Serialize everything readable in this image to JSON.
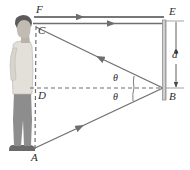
{
  "figure": {
    "labels": {
      "F": "F",
      "C": "C",
      "D": "D",
      "A": "A",
      "E": "E",
      "B": "B",
      "d": "d",
      "theta_upper": "θ",
      "theta_lower": "θ"
    },
    "colors": {
      "line": "#6e6e6e",
      "dashed": "#7d7d7d",
      "mirror": "#9a9a9a",
      "label": "#2b2b2b",
      "hair": "#5b5b5b",
      "skin": "#b9b2ab",
      "shirt": "#e3e0da",
      "pants": "#8d8d8d",
      "shoe": "#6a6a6a"
    },
    "points": {
      "F": {
        "x": 34,
        "y": 17
      },
      "C": {
        "x": 36,
        "y": 27
      },
      "D": {
        "x": 36,
        "y": 88
      },
      "A": {
        "x": 35,
        "y": 148
      },
      "E": {
        "x": 164,
        "y": 21
      },
      "B": {
        "x": 164,
        "y": 88
      }
    },
    "rays": [
      {
        "name": "ray-F-to-E",
        "from": "F",
        "to": "E",
        "direction": "right"
      },
      {
        "name": "ray-E-to-F",
        "from": "E",
        "to": "F",
        "direction": "left"
      },
      {
        "name": "ray-B-to-C",
        "from": "B",
        "to": "C",
        "direction": "left"
      },
      {
        "name": "ray-A-to-B",
        "from": "A",
        "to": "B",
        "direction": "right"
      }
    ],
    "mirror": {
      "x": 164,
      "top": 20,
      "bottom": 100
    },
    "dimension": {
      "label": "d",
      "from": "E",
      "to": "B",
      "x": 176
    }
  }
}
